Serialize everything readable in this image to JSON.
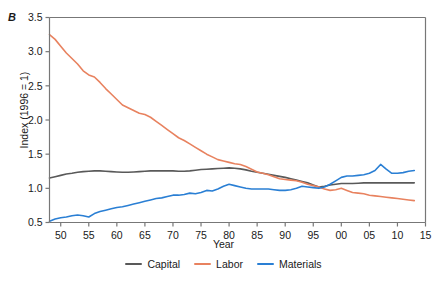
{
  "panel": {
    "label": "B"
  },
  "axes": {
    "ylabel": "Index (1996 = 1)",
    "xlabel": "Year",
    "yticks": [
      "0.5",
      "1.0",
      "1.5",
      "2.0",
      "2.5",
      "3.0",
      "3.5"
    ],
    "xticks": [
      "50",
      "55",
      "60",
      "65",
      "70",
      "75",
      "80",
      "85",
      "90",
      "95",
      "00",
      "05",
      "10",
      "15"
    ]
  },
  "legend": {
    "items": [
      {
        "label": "Capital",
        "color": "#595959"
      },
      {
        "label": "Labor",
        "color": "#e8825f"
      },
      {
        "label": "Materials",
        "color": "#2a7fd4"
      }
    ]
  },
  "chart_data": {
    "type": "line",
    "title": "",
    "xlabel": "Year",
    "ylabel": "Index (1996 = 1)",
    "xlim": [
      1948,
      2015
    ],
    "ylim": [
      0.5,
      3.5
    ],
    "grid": false,
    "legend_position": "bottom-center",
    "xtick_values": [
      1950,
      1955,
      1960,
      1965,
      1970,
      1975,
      1980,
      1985,
      1990,
      1995,
      2000,
      2005,
      2010,
      2015
    ],
    "ytick_values": [
      0.5,
      1.0,
      1.5,
      2.0,
      2.5,
      3.0,
      3.5
    ],
    "x": [
      1948,
      1949,
      1950,
      1951,
      1952,
      1953,
      1954,
      1955,
      1956,
      1957,
      1958,
      1959,
      1960,
      1961,
      1962,
      1963,
      1964,
      1965,
      1966,
      1967,
      1968,
      1969,
      1970,
      1971,
      1972,
      1973,
      1974,
      1975,
      1976,
      1977,
      1978,
      1979,
      1980,
      1981,
      1982,
      1983,
      1984,
      1985,
      1986,
      1987,
      1988,
      1989,
      1990,
      1991,
      1992,
      1993,
      1994,
      1995,
      1996,
      1997,
      1998,
      1999,
      2000,
      2001,
      2002,
      2003,
      2004,
      2005,
      2006,
      2007,
      2008,
      2009,
      2010,
      2011,
      2012,
      2013
    ],
    "series": [
      {
        "name": "Capital",
        "color": "#595959",
        "values": [
          1.15,
          1.17,
          1.19,
          1.21,
          1.22,
          1.235,
          1.245,
          1.25,
          1.255,
          1.255,
          1.25,
          1.245,
          1.24,
          1.235,
          1.235,
          1.24,
          1.245,
          1.25,
          1.255,
          1.255,
          1.255,
          1.255,
          1.255,
          1.25,
          1.25,
          1.255,
          1.265,
          1.275,
          1.28,
          1.285,
          1.29,
          1.295,
          1.3,
          1.295,
          1.285,
          1.27,
          1.25,
          1.235,
          1.22,
          1.205,
          1.19,
          1.175,
          1.16,
          1.14,
          1.12,
          1.1,
          1.08,
          1.05,
          1.02,
          1.03,
          1.05,
          1.06,
          1.07,
          1.07,
          1.07,
          1.075,
          1.08,
          1.08,
          1.08,
          1.08,
          1.08,
          1.08,
          1.08,
          1.08,
          1.08,
          1.08
        ]
      },
      {
        "name": "Labor",
        "color": "#e8825f",
        "values": [
          3.25,
          3.18,
          3.08,
          2.98,
          2.9,
          2.82,
          2.72,
          2.66,
          2.63,
          2.55,
          2.46,
          2.38,
          2.3,
          2.22,
          2.18,
          2.14,
          2.1,
          2.08,
          2.04,
          1.98,
          1.92,
          1.86,
          1.8,
          1.74,
          1.7,
          1.65,
          1.6,
          1.55,
          1.5,
          1.46,
          1.42,
          1.4,
          1.38,
          1.36,
          1.35,
          1.32,
          1.28,
          1.24,
          1.22,
          1.2,
          1.17,
          1.14,
          1.13,
          1.12,
          1.11,
          1.09,
          1.06,
          1.04,
          1.02,
          0.99,
          0.97,
          0.98,
          1.0,
          0.97,
          0.94,
          0.93,
          0.92,
          0.9,
          0.89,
          0.88,
          0.87,
          0.86,
          0.85,
          0.84,
          0.83,
          0.82
        ]
      },
      {
        "name": "Materials",
        "color": "#2a7fd4",
        "values": [
          0.52,
          0.55,
          0.57,
          0.58,
          0.6,
          0.61,
          0.6,
          0.58,
          0.63,
          0.66,
          0.68,
          0.7,
          0.72,
          0.73,
          0.75,
          0.77,
          0.79,
          0.81,
          0.83,
          0.85,
          0.86,
          0.88,
          0.9,
          0.9,
          0.91,
          0.93,
          0.92,
          0.94,
          0.97,
          0.96,
          0.99,
          1.03,
          1.06,
          1.04,
          1.02,
          1.0,
          0.99,
          0.99,
          0.99,
          0.99,
          0.98,
          0.97,
          0.97,
          0.98,
          1.0,
          1.03,
          1.02,
          1.01,
          1.0,
          1.02,
          1.06,
          1.11,
          1.16,
          1.18,
          1.18,
          1.19,
          1.2,
          1.22,
          1.26,
          1.35,
          1.28,
          1.22,
          1.22,
          1.23,
          1.25,
          1.26
        ]
      }
    ]
  }
}
